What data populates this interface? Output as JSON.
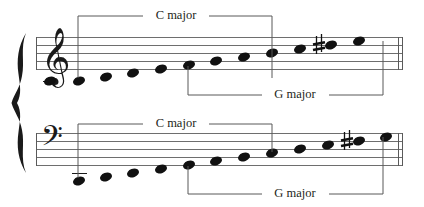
{
  "figure": {
    "background_color": "#ffffff",
    "ink_color": "#111111",
    "staff_line_color": "#6e6e6e",
    "bracket_color": "#595959"
  },
  "systems": [
    {
      "id": "treble-system",
      "clef": {
        "name": "treble-clef",
        "glyph": "𝄞",
        "label": "Treble clef"
      },
      "staff": {
        "top_line_y": 37,
        "line_spacing": 8,
        "line_count": 5,
        "left_x": 36,
        "right_x": 403
      },
      "notes": [
        {
          "index": 1,
          "name": "C4",
          "x": 49,
          "y": 81,
          "ledger": false
        },
        {
          "index": 2,
          "name": "D4",
          "x": 79,
          "y": 81,
          "ledger": false
        },
        {
          "index": 3,
          "name": "E4",
          "x": 105,
          "y": 77,
          "ledger": false
        },
        {
          "index": 4,
          "name": "F4",
          "x": 133,
          "y": 73,
          "ledger": false
        },
        {
          "index": 5,
          "name": "G4",
          "x": 160,
          "y": 69,
          "ledger": false
        },
        {
          "index": 6,
          "name": "A4",
          "x": 188,
          "y": 65,
          "ledger": false
        },
        {
          "index": 7,
          "name": "B4",
          "x": 216,
          "y": 61,
          "ledger": false
        },
        {
          "index": 8,
          "name": "C5",
          "x": 243,
          "y": 57,
          "ledger": false
        },
        {
          "index": 9,
          "name": "D5",
          "x": 271,
          "y": 53,
          "ledger": false
        },
        {
          "index": 10,
          "name": "E5",
          "x": 299,
          "y": 49,
          "ledger": false
        },
        {
          "index": 11,
          "name": "F#5",
          "x": 330,
          "y": 45,
          "ledger": false
        },
        {
          "index": 12,
          "name": "G5",
          "x": 358,
          "y": 41,
          "ledger": false
        }
      ],
      "accidental": {
        "name": "sharp-sign",
        "glyph": "♯",
        "applies_to": "F#5",
        "x": 318,
        "y": 45
      },
      "brackets": [
        {
          "id": "treble-c-major",
          "label": "C major",
          "label_x": 175,
          "label_y": 16,
          "line_y": 16,
          "left_x": 78,
          "right_x": 272,
          "drop_to_y": 78,
          "tick_direction": "down"
        },
        {
          "id": "treble-g-major",
          "label": "G major",
          "label_x": 295,
          "label_y": 95,
          "line_y": 95,
          "left_x": 188,
          "right_x": 383,
          "drop_to_y": 70,
          "tick_direction": "up"
        }
      ]
    },
    {
      "id": "bass-system",
      "clef": {
        "name": "bass-clef",
        "glyph": "𝄢",
        "label": "Bass clef"
      },
      "staff": {
        "top_line_y": 133,
        "line_spacing": 8,
        "line_count": 5,
        "left_x": 36,
        "right_x": 403
      },
      "notes": [
        {
          "index": 1,
          "name": "C2",
          "x": 79,
          "y": 181,
          "ledger": true
        },
        {
          "index": 2,
          "name": "D2",
          "x": 105,
          "y": 177,
          "ledger": false
        },
        {
          "index": 3,
          "name": "E2",
          "x": 133,
          "y": 173,
          "ledger": false
        },
        {
          "index": 4,
          "name": "F2",
          "x": 160,
          "y": 169,
          "ledger": false
        },
        {
          "index": 5,
          "name": "G2",
          "x": 188,
          "y": 165,
          "ledger": false
        },
        {
          "index": 6,
          "name": "A2",
          "x": 216,
          "y": 161,
          "ledger": false
        },
        {
          "index": 7,
          "name": "B2",
          "x": 243,
          "y": 157,
          "ledger": false
        },
        {
          "index": 8,
          "name": "C3",
          "x": 271,
          "y": 153,
          "ledger": false
        },
        {
          "index": 9,
          "name": "D3",
          "x": 299,
          "y": 149,
          "ledger": false
        },
        {
          "index": 10,
          "name": "E3",
          "x": 327,
          "y": 145,
          "ledger": false
        },
        {
          "index": 11,
          "name": "F#3",
          "x": 358,
          "y": 141,
          "ledger": false
        },
        {
          "index": 12,
          "name": "G3",
          "x": 385,
          "y": 137,
          "ledger": false
        }
      ],
      "accidental": {
        "name": "sharp-sign",
        "glyph": "♯",
        "applies_to": "F#3",
        "x": 346,
        "y": 141
      },
      "brackets": [
        {
          "id": "bass-c-major",
          "label": "C major",
          "label_x": 175,
          "label_y": 124,
          "line_y": 124,
          "left_x": 78,
          "right_x": 272,
          "drop_to_y": 178,
          "tick_direction": "down"
        },
        {
          "id": "bass-g-major",
          "label": "G major",
          "label_x": 295,
          "label_y": 194,
          "line_y": 194,
          "left_x": 188,
          "right_x": 383,
          "drop_to_y": 166,
          "tick_direction": "up"
        }
      ]
    }
  ],
  "labels": {
    "c_major": "C major",
    "g_major": "G major"
  },
  "brace": {
    "name": "system-brace",
    "x": 22,
    "top_y": 33,
    "bottom_y": 173
  }
}
